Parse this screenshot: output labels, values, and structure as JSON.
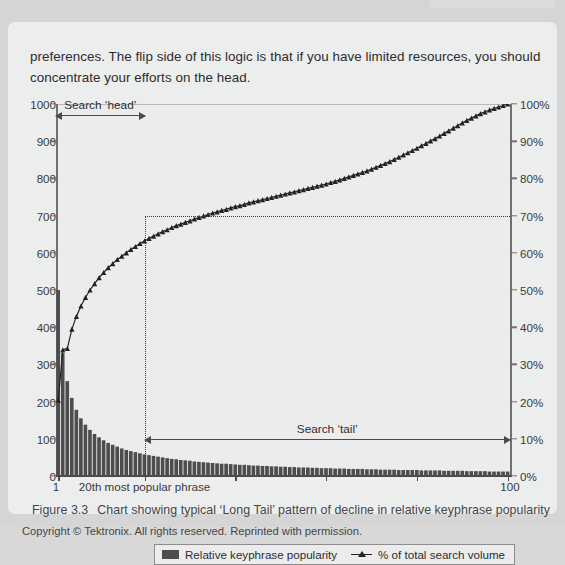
{
  "document": {
    "body_paragraph": "preferences. The flip side of this logic is that if you have limited resources, you should concentrate your efforts on the head.",
    "figure_number": "Figure 3.3",
    "figure_caption": "Chart showing typical ‘Long Tail’ pattern of decline in relative keyphrase popularity",
    "copyright": "Copyright © Tektronix. All rights reserved. Reprinted with permission."
  },
  "chart_data": {
    "type": "bar",
    "title": "",
    "xlabel": "",
    "ylabel": "",
    "grid": false,
    "legend_position": "bottom",
    "x_axis": {
      "tick_labels": [
        "1",
        "20th most popular phrase",
        "100"
      ],
      "tick_positions": [
        1,
        20,
        100
      ],
      "range": [
        1,
        100
      ]
    },
    "y_axis_left": {
      "label": "",
      "ticks": [
        0,
        100,
        200,
        300,
        400,
        500,
        600,
        700,
        800,
        900,
        1000
      ],
      "tick_labels": [
        "0",
        "100",
        "200",
        "300",
        "400",
        "500",
        "600",
        "700",
        "800",
        "900",
        "1000"
      ],
      "range": [
        0,
        1000
      ]
    },
    "y_axis_right": {
      "label": "",
      "ticks": [
        0,
        10,
        20,
        30,
        40,
        50,
        60,
        70,
        80,
        90,
        100
      ],
      "tick_labels": [
        "0%",
        "10%",
        "20%",
        "30%",
        "40%",
        "50%",
        "60%",
        "70%",
        "80%",
        "90%",
        "100%"
      ],
      "range": [
        0,
        100
      ]
    },
    "annotations": [
      {
        "name": "search-head",
        "label": "Search ‘head’",
        "from_x": 1,
        "to_x": 20,
        "y_pct": 97
      },
      {
        "name": "search-tail",
        "label": "Search ‘tail’",
        "from_x": 20,
        "to_x": 100,
        "y_pct": 10
      },
      {
        "name": "seventy-percent-marker",
        "label": "",
        "x": 20,
        "y_pct": 70
      }
    ],
    "series": [
      {
        "name": "Relative keyphrase popularity",
        "type": "bar",
        "axis": "left",
        "color": "#4d4d50",
        "values": [
          500,
          330,
          255,
          210,
          178,
          155,
          138,
          124,
          113,
          104,
          96,
          89,
          84,
          79,
          74,
          70,
          67,
          64,
          61,
          58,
          56,
          54,
          52,
          50,
          48,
          46,
          45,
          43,
          42,
          41,
          39,
          38,
          37,
          36,
          35,
          34,
          33,
          33,
          32,
          31,
          30,
          30,
          29,
          28,
          28,
          27,
          27,
          26,
          26,
          25,
          25,
          24,
          24,
          23,
          23,
          23,
          22,
          22,
          21,
          21,
          21,
          20,
          20,
          20,
          19,
          19,
          19,
          19,
          18,
          18,
          18,
          17,
          17,
          17,
          17,
          16,
          16,
          16,
          16,
          16,
          15,
          15,
          15,
          15,
          15,
          14,
          14,
          14,
          14,
          14,
          13,
          13,
          13,
          13,
          13,
          12,
          12,
          12,
          12,
          12
        ]
      },
      {
        "name": "% of total search volume",
        "type": "line",
        "marker": "triangle",
        "axis": "right",
        "color": "#232326",
        "values": [
          20.4,
          33.9,
          34.3,
          39.5,
          42.9,
          45.7,
          48.0,
          50.0,
          51.7,
          53.3,
          54.7,
          56.0,
          57.1,
          58.2,
          59.1,
          60.0,
          60.9,
          61.7,
          62.5,
          63.2,
          63.9,
          64.5,
          65.1,
          65.7,
          66.2,
          66.8,
          67.3,
          67.7,
          68.2,
          68.6,
          69.1,
          69.5,
          69.9,
          70.3,
          70.7,
          71.0,
          71.4,
          71.7,
          72.1,
          72.4,
          72.7,
          73.0,
          73.4,
          73.7,
          74.0,
          74.3,
          74.6,
          74.9,
          75.2,
          75.5,
          75.8,
          76.1,
          76.4,
          76.7,
          77.0,
          77.3,
          77.6,
          77.9,
          78.2,
          78.5,
          78.9,
          79.2,
          79.6,
          80.0,
          80.4,
          80.8,
          81.2,
          81.6,
          82.0,
          82.5,
          83.0,
          83.5,
          84.0,
          84.5,
          85.1,
          85.7,
          86.3,
          86.9,
          87.5,
          88.1,
          88.8,
          89.4,
          90.1,
          90.7,
          91.4,
          92.1,
          92.8,
          93.5,
          94.2,
          94.9,
          95.6,
          96.2,
          96.8,
          97.4,
          97.9,
          98.4,
          98.8,
          99.2,
          99.6,
          100.0
        ]
      }
    ]
  },
  "legend": {
    "items": [
      {
        "label": "Relative keyphrase popularity",
        "swatch": "bar-swatch"
      },
      {
        "label": "% of total search volume",
        "swatch": "line-triangle-swatch"
      }
    ]
  }
}
